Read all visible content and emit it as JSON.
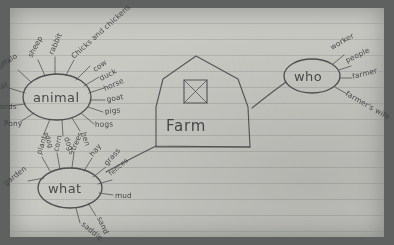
{
  "medium": "hand-drawn pencil sketch on lined notebook paper",
  "colors": {
    "paper": "#c9c9c4",
    "mat": "#5f6160",
    "pencil": "#45474a",
    "rule_line": "#929592"
  },
  "center": {
    "name": "barn",
    "label": "Farm",
    "window_icon": "crossed-window-icon"
  },
  "nodes": [
    {
      "id": "animal",
      "label": "animal",
      "leaves": [
        "sheep",
        "rabbit",
        "Chicks and chickens",
        "cow",
        "duck",
        "horse",
        "goat",
        "pigs",
        "hogs",
        "hen",
        "dogs",
        "dog",
        "Pony",
        "birds",
        "cat",
        "buffalo"
      ]
    },
    {
      "id": "what",
      "label": "what",
      "leaves": [
        "garden",
        "plants",
        "corn",
        "trees",
        "hay",
        "grass",
        "fences",
        "mud",
        "sand",
        "saddle"
      ]
    },
    {
      "id": "who",
      "label": "who",
      "leaves": [
        "worker",
        "people",
        "farmer",
        "farmer's wife"
      ]
    }
  ],
  "connectors": [
    {
      "from": "barn",
      "to": "who"
    },
    {
      "from": "barn",
      "to": "what"
    }
  ]
}
